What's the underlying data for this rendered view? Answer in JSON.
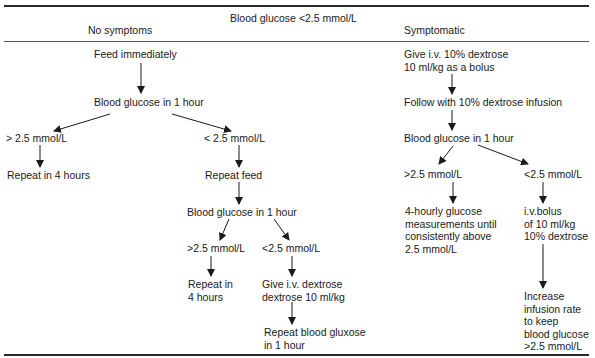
{
  "header": {
    "condition": "Blood glucose <2.5 mmol/L",
    "col_left": "No symptoms",
    "col_right": "Symptomatic"
  },
  "left": {
    "feed": "Feed immediately",
    "bg1": "Blood glucose in 1 hour",
    "gt1": "> 2.5 mmol/L",
    "lt1": "< 2.5 mmol/L",
    "repeat4": "Repeat in 4 hours",
    "repeat_feed": "Repeat feed",
    "bg2": "Blood glucose in 1 hour",
    "gt2": ">2.5 mmol/L",
    "lt2": "<2.5 mmol/L",
    "repeat_in_l1": "Repeat in",
    "repeat_in_l2": "4 hours",
    "give_iv_l1": "Give i.v. dextrose",
    "give_iv_l2": "dextrose 10 ml/kg",
    "repeat_bg_l1": "Repeat blood gluxose",
    "repeat_bg_l2": "in 1 hour"
  },
  "right": {
    "give_l1": "Give i.v. 10% dextrose",
    "give_l2": "10 ml/kg as a bolus",
    "follow": "Follow with 10% dextrose infusion",
    "bg": "Blood glucose in 1 hour",
    "gt": ">2.5 mmol/L",
    "lt": "<2.5 mmol/L",
    "hourly_l1": "4-hourly glucose",
    "hourly_l2": "measurements until",
    "hourly_l3": "consistently above",
    "hourly_l4": "2.5 mmol/L",
    "bolus_l1": "i.v.bolus",
    "bolus_l2": "of 10 ml/kg",
    "bolus_l3": "10% dextrose",
    "incr_l1": "Increase",
    "incr_l2": "infusion rate",
    "incr_l3": "to keep",
    "incr_l4": "blood glucose",
    "incr_l5": ">2.5 mmol/L"
  }
}
